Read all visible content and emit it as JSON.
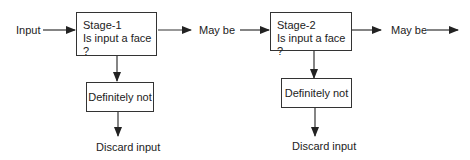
{
  "diagram": {
    "input_label": "Input",
    "stages": [
      {
        "title": "Stage-1",
        "question": "Is input a face ?",
        "pass_label": "May be",
        "reject_label": "Definitely not",
        "discard_label": "Discard input"
      },
      {
        "title": "Stage-2",
        "question": "Is input a face ?",
        "pass_label": "May be",
        "reject_label": "Definitely not",
        "discard_label": "Discard input"
      }
    ],
    "colors": {
      "line": "#333333",
      "text": "#222222",
      "background": "#ffffff"
    }
  }
}
